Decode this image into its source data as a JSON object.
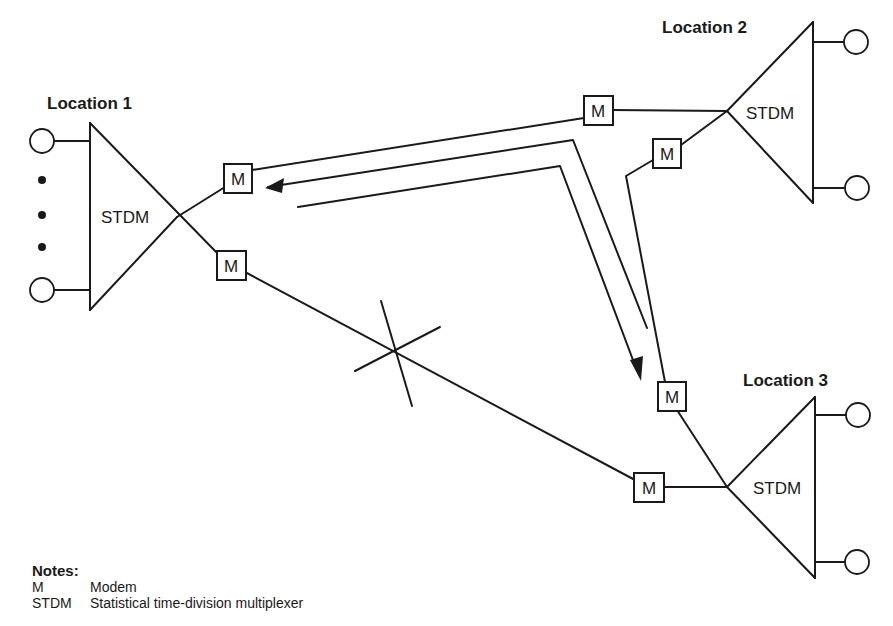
{
  "locations": [
    {
      "label": "Location 1",
      "mux_label": "STDM"
    },
    {
      "label": "Location 2",
      "mux_label": "STDM"
    },
    {
      "label": "Location 3",
      "mux_label": "STDM"
    }
  ],
  "modem_label": "M",
  "notes": {
    "title": "Notes:",
    "items": [
      {
        "abbr": "M",
        "meaning": "Modem"
      },
      {
        "abbr": "STDM",
        "meaning": "Statistical time-division multiplexer"
      }
    ]
  },
  "links": [
    {
      "from": "Location 1",
      "to": "Location 2",
      "status": "active"
    },
    {
      "from": "Location 2",
      "to": "Location 3",
      "status": "active"
    },
    {
      "from": "Location 1",
      "to": "Location 3",
      "status": "broken"
    }
  ],
  "reroute_path": {
    "from": "Location 3",
    "via": "Location 2",
    "to": "Location 1",
    "bidirectional": true
  },
  "colors": {
    "ink": "#1a1a1a",
    "background": "#ffffff"
  }
}
